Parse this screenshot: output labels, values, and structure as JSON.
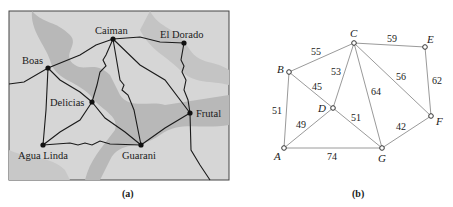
{
  "panel_a": {
    "caption": "(a)",
    "cities": [
      {
        "name": "Caiman",
        "x": 113,
        "y": 39,
        "lx": 95,
        "ly": 34
      },
      {
        "name": "El Dorado",
        "x": 184,
        "y": 43,
        "lx": 160,
        "ly": 38
      },
      {
        "name": "Boas",
        "x": 48,
        "y": 68,
        "lx": 22,
        "ly": 64
      },
      {
        "name": "Delicias",
        "x": 92,
        "y": 102,
        "lx": 50,
        "ly": 106
      },
      {
        "name": "Frutal",
        "x": 190,
        "y": 113,
        "lx": 196,
        "ly": 117
      },
      {
        "name": "Agua Linda",
        "x": 43,
        "y": 145,
        "lx": 18,
        "ly": 159
      },
      {
        "name": "Guarani",
        "x": 141,
        "y": 145,
        "lx": 122,
        "ly": 159
      }
    ],
    "roads": [
      [
        "Boas",
        "Caiman"
      ],
      [
        "Caiman",
        "El Dorado"
      ],
      [
        "El Dorado",
        "Frutal"
      ],
      [
        "Boas",
        "Delicias"
      ],
      [
        "Boas",
        "Agua Linda"
      ],
      [
        "Caiman",
        "Delicias"
      ],
      [
        "Caiman",
        "Guarani"
      ],
      [
        "Caiman",
        "Frutal"
      ],
      [
        "Delicias",
        "Agua Linda"
      ],
      [
        "Delicias",
        "Guarani"
      ],
      [
        "Agua Linda",
        "Guarani"
      ],
      [
        "Guarani",
        "Frutal"
      ]
    ]
  },
  "panel_b": {
    "caption": "(b)",
    "nodes": [
      {
        "id": "A",
        "x": 284,
        "y": 148,
        "lx": 274,
        "ly": 160
      },
      {
        "id": "B",
        "x": 289,
        "y": 72,
        "lx": 277,
        "ly": 72
      },
      {
        "id": "C",
        "x": 354,
        "y": 43,
        "lx": 350,
        "ly": 37
      },
      {
        "id": "D",
        "x": 333,
        "y": 108,
        "lx": 318,
        "ly": 112
      },
      {
        "id": "E",
        "x": 425,
        "y": 47,
        "lx": 427,
        "ly": 43
      },
      {
        "id": "F",
        "x": 431,
        "y": 116,
        "lx": 436,
        "ly": 125
      },
      {
        "id": "G",
        "x": 382,
        "y": 148,
        "lx": 378,
        "ly": 162
      }
    ],
    "edges": [
      {
        "from": "B",
        "to": "C",
        "weight": "55",
        "lx": 311,
        "ly": 55
      },
      {
        "from": "C",
        "to": "E",
        "weight": "59",
        "lx": 387,
        "ly": 42
      },
      {
        "from": "C",
        "to": "D",
        "weight": "53",
        "lx": 331,
        "ly": 75
      },
      {
        "from": "B",
        "to": "D",
        "weight": "45",
        "lx": 312,
        "ly": 90
      },
      {
        "from": "C",
        "to": "G",
        "weight": "64",
        "lx": 371,
        "ly": 95
      },
      {
        "from": "C",
        "to": "F",
        "weight": "56",
        "lx": 396,
        "ly": 80
      },
      {
        "from": "E",
        "to": "F",
        "weight": "62",
        "lx": 432,
        "ly": 84
      },
      {
        "from": "A",
        "to": "B",
        "weight": "51",
        "lx": 272,
        "ly": 114
      },
      {
        "from": "A",
        "to": "D",
        "weight": "49",
        "lx": 296,
        "ly": 128
      },
      {
        "from": "D",
        "to": "G",
        "weight": "51",
        "lx": 351,
        "ly": 121
      },
      {
        "from": "G",
        "to": "F",
        "weight": "42",
        "lx": 396,
        "ly": 130
      },
      {
        "from": "A",
        "to": "G",
        "weight": "74",
        "lx": 327,
        "ly": 160
      }
    ]
  }
}
